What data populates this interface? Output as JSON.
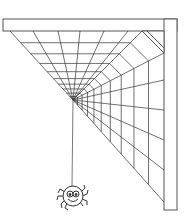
{
  "illustration": {
    "subject": "spider hanging from a corner cobweb",
    "colors": {
      "background": "#ffffff",
      "line": "#333333",
      "frame_stroke": "#555555"
    },
    "frame": {
      "top_bar": {
        "x": 3,
        "y": 19,
        "width": 174,
        "height": 12
      },
      "right_bar": {
        "x": 164,
        "y": 19,
        "width": 13,
        "height": 191
      }
    },
    "web": {
      "hub": {
        "x": 73,
        "y": 100
      },
      "radials": 10,
      "rings": 9
    },
    "thread": {
      "from": {
        "x": 73,
        "y": 100
      },
      "to": {
        "x": 72,
        "y": 186
      }
    },
    "spider": {
      "center": {
        "x": 73,
        "y": 196
      },
      "radius": 10,
      "expression": "smiling"
    }
  }
}
